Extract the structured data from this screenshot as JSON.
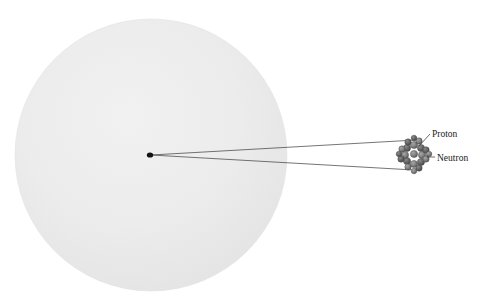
{
  "figure": {
    "type": "atom-nucleus-magnification-diagram",
    "background_color": "#ffffff"
  },
  "atom": {
    "name": "atom-body",
    "shape": "circle",
    "center_x": 151,
    "center_y": 155,
    "radius": 136,
    "fill_color": "#ebebeb",
    "edge_color": "#e4e4e4"
  },
  "nucleus_point": {
    "name": "nucleus-point",
    "center_x": 150,
    "center_y": 155,
    "radius_x": 3.2,
    "radius_y": 2.6,
    "color": "#121212"
  },
  "magnifier": {
    "name": "magnification-cone",
    "line_color": "#3a3a3a",
    "line_width": 0.7,
    "apex_x": 151,
    "apex_y": 155,
    "top_end_x": 416,
    "top_end_y": 140,
    "bottom_end_x": 414,
    "bottom_end_y": 170
  },
  "nucleus_cluster": {
    "name": "nucleus-cluster",
    "center_x": 414,
    "center_y": 154,
    "radius": 15,
    "outline_color": "#4a4a4a",
    "proton_color": "#7e7e7e",
    "neutron_color": "#5a5a5a",
    "particles": [
      {
        "x": 414,
        "y": 154,
        "r": 3.6,
        "kind": "proton"
      },
      {
        "x": 407,
        "y": 148,
        "r": 3.6,
        "kind": "neutron"
      },
      {
        "x": 414,
        "y": 145,
        "r": 3.6,
        "kind": "proton"
      },
      {
        "x": 421,
        "y": 148,
        "r": 3.6,
        "kind": "neutron"
      },
      {
        "x": 422,
        "y": 155,
        "r": 3.6,
        "kind": "proton"
      },
      {
        "x": 421,
        "y": 162,
        "r": 3.6,
        "kind": "neutron"
      },
      {
        "x": 414,
        "y": 164,
        "r": 3.6,
        "kind": "proton"
      },
      {
        "x": 407,
        "y": 161,
        "r": 3.6,
        "kind": "neutron"
      },
      {
        "x": 405,
        "y": 155,
        "r": 3.6,
        "kind": "proton"
      },
      {
        "x": 408,
        "y": 142,
        "r": 3.2,
        "kind": "neutron"
      },
      {
        "x": 419,
        "y": 141,
        "r": 3.2,
        "kind": "proton"
      },
      {
        "x": 402,
        "y": 149,
        "r": 3.2,
        "kind": "proton"
      },
      {
        "x": 426,
        "y": 150,
        "r": 3.2,
        "kind": "neutron"
      },
      {
        "x": 401,
        "y": 159,
        "r": 3.2,
        "kind": "neutron"
      },
      {
        "x": 426,
        "y": 159,
        "r": 3.2,
        "kind": "proton"
      },
      {
        "x": 408,
        "y": 167,
        "r": 3.2,
        "kind": "proton"
      },
      {
        "x": 419,
        "y": 168,
        "r": 3.2,
        "kind": "neutron"
      },
      {
        "x": 414,
        "y": 138,
        "r": 2.8,
        "kind": "neutron"
      },
      {
        "x": 414,
        "y": 171,
        "r": 2.8,
        "kind": "proton"
      },
      {
        "x": 399,
        "y": 154,
        "r": 2.8,
        "kind": "neutron"
      },
      {
        "x": 429,
        "y": 154,
        "r": 2.8,
        "kind": "proton"
      }
    ]
  },
  "labels": {
    "proton": {
      "text": "Proton",
      "text_x": 432,
      "text_y": 137,
      "leader_x1": 419,
      "leader_y1": 146,
      "leader_x2": 430,
      "leader_y2": 134
    },
    "neutron": {
      "text": "Neutron",
      "text_x": 437,
      "text_y": 161,
      "leader_x1": 427,
      "leader_y1": 157,
      "leader_x2": 435,
      "leader_y2": 157
    }
  },
  "colors": {
    "label_text": "#1b1b1b",
    "leader_line": "#2f2f2f"
  }
}
